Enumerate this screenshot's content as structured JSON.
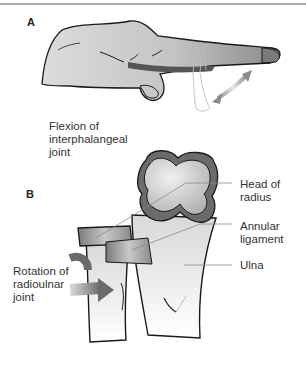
{
  "figure": {
    "panels": [
      {
        "letter": "A",
        "caption": "Flexion of\ninterphalangeal\njoint",
        "illustration": "hand-with-flexing-index-finger"
      },
      {
        "letter": "B",
        "illustration": "proximal-radius-and-ulna",
        "callouts": [
          {
            "text": "Head of\nradius"
          },
          {
            "text": "Annular\nligament"
          },
          {
            "text": "Ulna"
          }
        ],
        "side_label": "Rotation of\nradioulnar\njoint"
      }
    ],
    "colors": {
      "skin_light": "#cfcfcf",
      "skin_dark": "#6f6f6f",
      "bone": "#e6e6e6",
      "outline": "#1a1a1a",
      "arrow": "#8a8a8a",
      "leader": "#8c8c8c",
      "rule": "#a9a9a9"
    }
  }
}
